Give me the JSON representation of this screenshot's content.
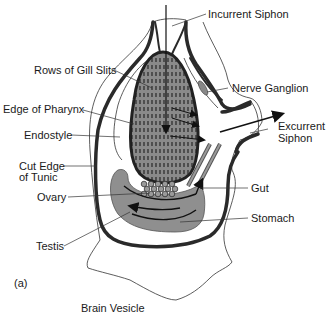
{
  "figure": {
    "panel_label": "(a)",
    "caption_below": "Brain Vesicle",
    "labels": {
      "incurrent_siphon": "Incurrent Siphon",
      "rows_of_gill_slits": "Rows of Gill Slits",
      "nerve_ganglion": "Nerve Ganglion",
      "edge_of_pharynx": "Edge of Pharynx",
      "excurrent_siphon_line1": "Excurrent",
      "excurrent_siphon_line2": "Siphon",
      "endostyle": "Endostyle",
      "cut_edge_line1": "Cut Edge",
      "cut_edge_line2": "of Tunic",
      "gut": "Gut",
      "ovary": "Ovary",
      "stomach": "Stomach",
      "testis": "Testis"
    },
    "colors": {
      "organ_fill": "#8f8f8f",
      "outline": "#2a2a2a",
      "background": "#ffffff"
    }
  }
}
